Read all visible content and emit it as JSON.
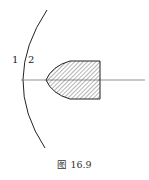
{
  "figure": {
    "caption": "图 16.9",
    "labels": {
      "region1": "1",
      "region2": "2"
    },
    "colors": {
      "stroke": "#222222",
      "axis": "#666666",
      "background": "#ffffff"
    }
  }
}
